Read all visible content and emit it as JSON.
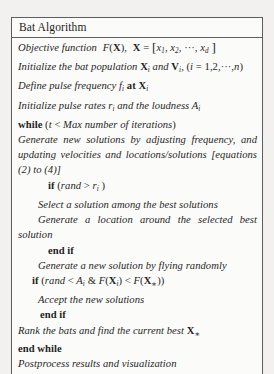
{
  "document": {
    "kind": "algorithm-pseudocode-box",
    "header": {
      "title": "Bat Algorithm"
    },
    "colors": {
      "page_background": "#f2f1ef",
      "box_background": "#fbfbfa",
      "border": "#5e5e5e",
      "text": "#1f1f1f"
    },
    "lines": [
      {
        "id": "objective-function",
        "indent": 0,
        "plain_text": "Objective function F(X), X = [x1, x2, ···, xd]"
      },
      {
        "id": "initialize-population",
        "indent": 0,
        "plain_text": "Initialize the bat population Xi and Vi, (i = 1,2,···,n)"
      },
      {
        "id": "define-pulse-frequency",
        "indent": 0,
        "plain_text": "Define pulse frequency fi at Xi"
      },
      {
        "id": "initialize-pulse-rates",
        "indent": 0,
        "plain_text": "Initialize pulse rates ri and the loudness Ai"
      },
      {
        "id": "while-statement",
        "indent": 0,
        "plain_text": "while (t < Max number of iterations)"
      },
      {
        "id": "generate-new-solutions",
        "indent": 0,
        "plain_text": "Generate new solutions by adjusting frequency, and updating velocities and locations/solutions [equations (2) to (4)]"
      },
      {
        "id": "if-rand-greater-r",
        "indent": 2,
        "plain_text": "if (rand > ri)"
      },
      {
        "id": "select-solution",
        "indent": 1,
        "plain_text": "Select a solution among the best solutions"
      },
      {
        "id": "generate-location",
        "indent": 1,
        "plain_text": "Generate a location around the selected best solution"
      },
      {
        "id": "end-if-1",
        "indent": 2,
        "plain_text": "end if"
      },
      {
        "id": "generate-flying-randomly",
        "indent": 1,
        "plain_text": "Generate a new solution by flying randomly"
      },
      {
        "id": "if-rand-less-a",
        "indent": 1,
        "plain_text": "if (rand < Ai & F(Xi) < F(X*))"
      },
      {
        "id": "accept-new-solutions",
        "indent": 1,
        "plain_text": "Accept the new solutions"
      },
      {
        "id": "end-if-2",
        "indent": 1,
        "plain_text": "end if"
      },
      {
        "id": "rank-bats",
        "indent": 0,
        "plain_text": "Rank the bats and find the current best X*"
      },
      {
        "id": "end-while",
        "indent": 0,
        "plain_text": "end while"
      },
      {
        "id": "postprocess",
        "indent": 0,
        "plain_text": "Postprocess results and visualization"
      }
    ]
  }
}
